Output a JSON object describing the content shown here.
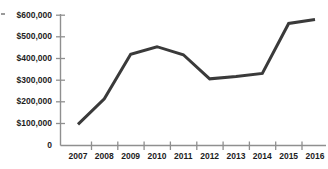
{
  "chart_data": {
    "type": "line",
    "title": "",
    "subtitle": "",
    "xlabel": "",
    "ylabel": "",
    "categories": [
      "2007",
      "2008",
      "2009",
      "2010",
      "2011",
      "2012",
      "2013",
      "2014",
      "2015",
      "2016"
    ],
    "values": [
      97000,
      215000,
      420000,
      455000,
      418000,
      307000,
      318000,
      332000,
      562000,
      580000
    ],
    "series": [
      {
        "name": "",
        "values": [
          97000,
          215000,
          420000,
          455000,
          418000,
          307000,
          318000,
          332000,
          562000,
          580000
        ]
      }
    ],
    "ylim": [
      0,
      600000
    ],
    "ytick_values": [
      0,
      100000,
      200000,
      300000,
      400000,
      500000,
      600000
    ],
    "ytick_labels": [
      "0",
      "$100,000",
      "$200,000",
      "$300,000",
      "$400,000",
      "$500,000",
      "$600,000"
    ],
    "xtick_labels": [
      "2007",
      "2008",
      "2009",
      "2010",
      "2011",
      "2012",
      "2013",
      "2014",
      "2015",
      "2016"
    ],
    "grid": false,
    "legend": false,
    "legend_position": "none",
    "annotations": [],
    "colors": {
      "line": "#3a3a3a",
      "axis": "#8f8f8f",
      "tick_text": "#1d1d1d",
      "background": "#ffffff"
    },
    "line_width_px": 3
  }
}
